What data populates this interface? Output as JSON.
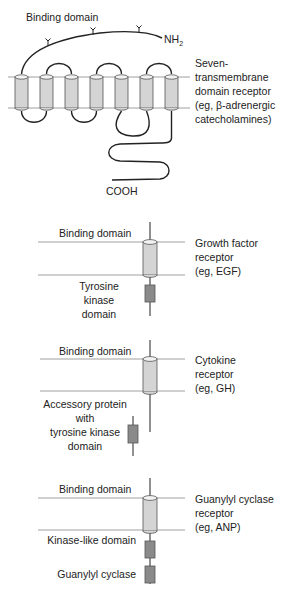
{
  "figure": {
    "colors": {
      "line": "#222222",
      "membrane": "#888888",
      "cylinder_fill": "#d4d4d4",
      "cylinder_top": "#f2f2f2",
      "domain_box": "#8a8a8a"
    },
    "panels": [
      {
        "id": "seven-tm",
        "binding_label": "Binding domain",
        "n_terminus": "NH",
        "n_terminus_sub": "2",
        "c_terminus": "COOH",
        "receptor_label": "Seven-\ntransmembrane\ndomain receptor\n(eg, β-adrenergic\ncatecholamines)",
        "helix_count": 7
      },
      {
        "id": "growth-factor",
        "binding_label": "Binding domain",
        "receptor_label": "Growth factor\nreceptor\n(eg, EGF)",
        "domain_labels": [
          "Tyrosine kinase\ndomain"
        ]
      },
      {
        "id": "cytokine",
        "binding_label": "Binding domain",
        "receptor_label": "Cytokine\nreceptor\n(eg, GH)",
        "domain_labels": [
          "Accessory protein with\ntyrosine kinase\ndomain"
        ]
      },
      {
        "id": "guanylyl-cyclase",
        "binding_label": "Binding domain",
        "receptor_label": "Guanylyl cyclase\nreceptor\n(eg, ANP)",
        "domain_labels": [
          "Kinase-like domain",
          "Guanylyl cyclase"
        ]
      }
    ]
  }
}
